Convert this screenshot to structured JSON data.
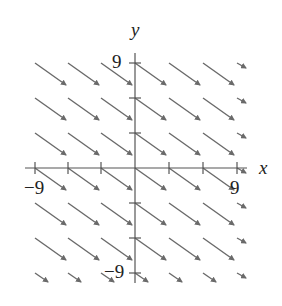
{
  "diagram": {
    "type": "slope field",
    "axis_labels": {
      "x": "x",
      "y": "y"
    },
    "tick_labels": {
      "x_min": "−9",
      "x_max": "9",
      "y_max": "9",
      "y_min": "−9"
    },
    "x_ticks": [
      -9,
      -6,
      -3,
      0,
      3,
      6,
      9
    ],
    "y_ticks": [
      -9,
      -6,
      -3,
      0,
      3,
      6,
      9
    ],
    "arrow_color": "#6a6a6a",
    "axis_color": "#555555"
  }
}
